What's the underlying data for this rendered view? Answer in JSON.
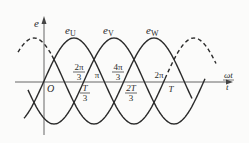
{
  "diagram": {
    "axes": {
      "y_label": "e",
      "x_label_top": "ωt",
      "x_label_bottom": "t",
      "origin_label": "O"
    },
    "curves": [
      {
        "name": "e_U",
        "label_main": "e",
        "label_sub": "U",
        "phase_deg": 0,
        "style": "solid"
      },
      {
        "name": "e_V",
        "label_main": "e",
        "label_sub": "V",
        "phase_deg": -120,
        "style": "solid"
      },
      {
        "name": "e_W",
        "label_main": "e",
        "label_sub": "W",
        "phase_deg": -240,
        "style": "solid"
      }
    ],
    "ticks_above": [
      {
        "num": "2π",
        "den": "3"
      },
      {
        "single": "π"
      },
      {
        "num": "4π",
        "den": "3"
      },
      {
        "single": "2π"
      }
    ],
    "ticks_below": [
      {
        "num": "T",
        "den": "3"
      },
      {
        "num": "2T",
        "den": "3"
      },
      {
        "single": "T"
      }
    ],
    "colors": {
      "stroke": "#2a2a2a",
      "axis": "#555555",
      "background": "#fbfbfa"
    }
  }
}
